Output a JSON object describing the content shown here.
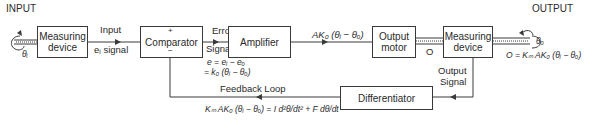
{
  "labels": {
    "input_title": "INPUT",
    "output_title": "OUTPUT",
    "theta_i": "θᵢ",
    "theta_o": "θₒ",
    "input_signal_line1": "Input",
    "input_signal_line2": "eᵢ signal",
    "error_signal_line1": "Error",
    "error_signal_line2": "Signal",
    "error_eq_line1": "e = eᵢ − eₒ",
    "error_eq_line2": "= k₀ (θᵢ − θₒ)",
    "amp_output": "AK₀ (θᵢ − θₒ)",
    "shaft_o": "O",
    "output_eq": "O = Kₘ AK₀ (θᵢ − θₒ)",
    "output_signal_line1": "Output",
    "output_signal_line2": "Signal",
    "feedback_loop": "Feedback Loop",
    "feedback_eq": "Kₘ AK₀ (θᵢ − θₒ) = I d²θ/dt² + F dθ/dt",
    "plus": "+",
    "minus": "−"
  },
  "blocks": {
    "measuring_in": {
      "line1": "Measuring",
      "line2": "device"
    },
    "comparator": {
      "line1": "Comparator"
    },
    "amplifier": {
      "line1": "Amplifier"
    },
    "output_motor": {
      "line1": "Output",
      "line2": "motor"
    },
    "measuring_out": {
      "line1": "Measuring",
      "line2": "device"
    },
    "differentiator": {
      "line1": "Differentiator"
    }
  }
}
